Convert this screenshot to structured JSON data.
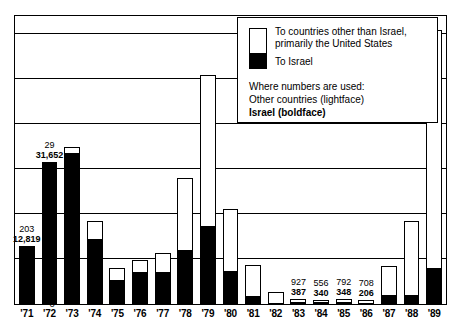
{
  "chart_data": {
    "type": "bar",
    "subtype": "stacked-bar",
    "title": "",
    "xlabel": "",
    "ylabel": "",
    "ylim": [
      0,
      64000
    ],
    "yticks": [
      0,
      10000,
      20000,
      30000,
      40000,
      50000,
      60000
    ],
    "ytick_labels": [
      "0",
      "10,000",
      "20,000",
      "30,000",
      "40,000",
      "50,000",
      "60,000"
    ],
    "grid": true,
    "legend_position": "top-right",
    "categories": [
      "'71",
      "'72",
      "'73",
      "'74",
      "'75",
      "'76",
      "'77",
      "'78",
      "'79",
      "'80",
      "'81",
      "'82",
      "'83",
      "'84",
      "'85",
      "'86",
      "'87",
      "'88",
      "'89"
    ],
    "series": [
      {
        "name": "To Israel",
        "color": "#000000",
        "values": [
          12819,
          31652,
          33500,
          14300,
          5200,
          6900,
          7100,
          11800,
          17200,
          7200,
          1700,
          200,
          387,
          340,
          348,
          206,
          2000,
          2000,
          8000
        ]
      },
      {
        "name": "To countries other than Israel, primarily the United States",
        "color": "#ffffff",
        "values": [
          203,
          29,
          1500,
          4200,
          2900,
          3100,
          4400,
          16300,
          33800,
          14100,
          7100,
          2500,
          927,
          556,
          792,
          708,
          6500,
          16600,
          53000
        ]
      }
    ],
    "totals": [
      13022,
      31681,
      35000,
      18500,
      8100,
      10000,
      11500,
      28100,
      51000,
      21300,
      8800,
      2700,
      1314,
      896,
      1140,
      914,
      8500,
      18600,
      61000
    ],
    "annotations": [
      {
        "category": "'71",
        "other": "203",
        "israel": "12,819"
      },
      {
        "category": "'72",
        "other": "29",
        "israel": "31,652"
      },
      {
        "category": "'83",
        "other": "927",
        "israel": "387"
      },
      {
        "category": "'84",
        "other": "556",
        "israel": "340"
      },
      {
        "category": "'85",
        "other": "792",
        "israel": "348"
      },
      {
        "category": "'86",
        "other": "708",
        "israel": "206"
      }
    ]
  },
  "legend": {
    "item_other": "To countries other than Israel, primarily the United States",
    "item_israel": "To Israel",
    "note_heading": "Where numbers are used:",
    "note_line1": "Other countries (lightface)",
    "note_line2": "Israel (boldface)"
  }
}
